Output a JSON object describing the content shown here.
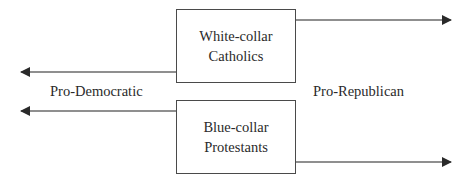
{
  "diagram": {
    "boxes": [
      {
        "id": "white-collar-catholics",
        "label": "White-collar\nCatholics"
      },
      {
        "id": "blue-collar-protestants",
        "label": "Blue-collar\nProtestants"
      }
    ],
    "labels": {
      "left": "Pro-Democratic",
      "right": "Pro-Republican"
    },
    "arrows": [
      {
        "from": "white-collar-catholics",
        "direction": "right",
        "meaning": "Pro-Republican"
      },
      {
        "from": "white-collar-catholics",
        "direction": "left",
        "meaning": "Pro-Democratic"
      },
      {
        "from": "blue-collar-protestants",
        "direction": "left",
        "meaning": "Pro-Democratic"
      },
      {
        "from": "blue-collar-protestants",
        "direction": "right",
        "meaning": "Pro-Republican"
      }
    ],
    "colors": {
      "line": "#4a4a4a",
      "text": "#2a2a2a",
      "background": "#ffffff"
    }
  }
}
